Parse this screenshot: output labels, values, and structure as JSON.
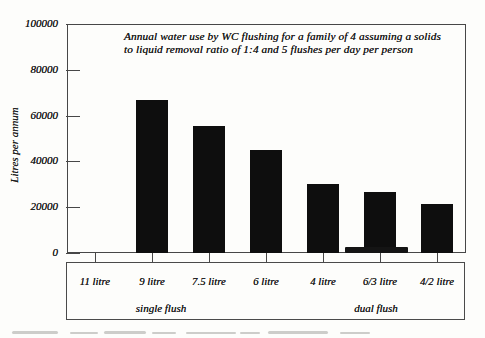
{
  "figure": {
    "title_line1": "Annual water use by WC flushing for a family of 4 assuming a solids",
    "title_line2": "to liquid removal ratio of 1:4 and 5 flushes per day per person"
  },
  "chart_data": {
    "type": "bar",
    "title": "Annual water use by WC flushing for a family of 4 assuming a solids to liquid removal ratio of 1:4 and 5 flushes per day per person",
    "ylabel": "Litres per annum",
    "xlabel": "",
    "ylim": [
      0,
      100000
    ],
    "yticks": [
      0,
      20000,
      40000,
      60000,
      80000,
      100000
    ],
    "grid": "off",
    "legend": "none",
    "bar_color": "#0e0e0e",
    "categories": [
      "11 litre",
      "9 litre",
      "7.5 litre",
      "6 litre",
      "4 litre",
      "6/3 litre",
      "4/2 litre"
    ],
    "values": [
      0,
      67000,
      55500,
      45000,
      30000,
      26500,
      21500
    ],
    "groups": [
      {
        "label": "single flush",
        "categories": [
          "11 litre",
          "9 litre",
          "7.5 litre",
          "6 litre",
          "4 litre"
        ]
      },
      {
        "label": "dual flush",
        "categories": [
          "6/3 litre",
          "4/2 litre"
        ]
      }
    ]
  }
}
